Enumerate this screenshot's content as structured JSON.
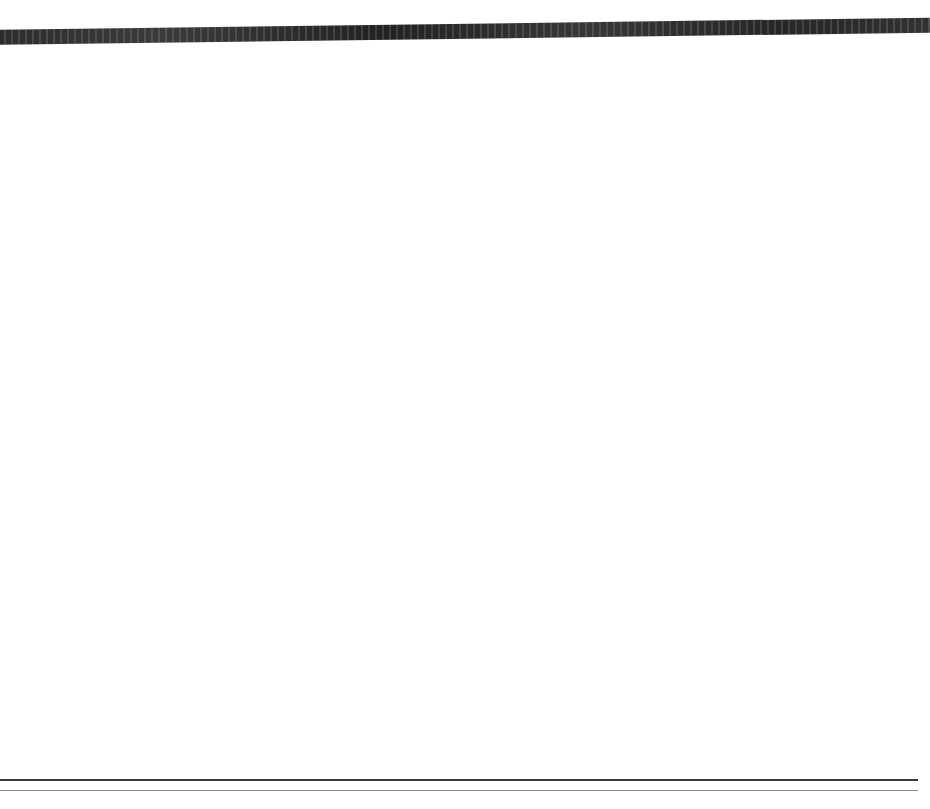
{
  "figure": {
    "y_axis_label": "x",
    "y_axis_label_sub": "t",
    "x_axis_label": "x",
    "x_axis_label_sub": "t-1",
    "caption_fragment": ""
  },
  "chart_data": {
    "type": "scatter",
    "title": "",
    "subtitle": "",
    "xlabel": "x t-1",
    "ylabel": "x t",
    "xlim": [
      0,
      140
    ],
    "ylim": [
      0,
      140
    ],
    "grid": false,
    "legend": null,
    "x_ticks": [
      10,
      20,
      30,
      40,
      50,
      60,
      70,
      80,
      90,
      100,
      110,
      120,
      130,
      140
    ],
    "y_ticks": [
      10,
      20,
      30,
      40,
      50,
      60,
      70,
      80,
      90,
      100,
      110,
      120,
      130,
      140
    ],
    "x": [
      25,
      31,
      32,
      42,
      58,
      59,
      61,
      61,
      63,
      65,
      66,
      66,
      68,
      72,
      80,
      80,
      82,
      82,
      82,
      83,
      85,
      90,
      90,
      92,
      97,
      113,
      122,
      130
    ],
    "y": [
      43,
      42,
      26,
      33,
      68,
      59,
      62,
      67,
      82,
      62,
      66,
      65,
      66,
      84,
      92,
      63,
      74,
      82,
      83,
      99,
      85,
      32,
      94,
      85,
      117,
      132,
      93,
      125
    ],
    "marker": "filled-circle",
    "marker_radius": 7,
    "points": [
      {
        "x": 25,
        "y": 43,
        "highlight": false
      },
      {
        "x": 31,
        "y": 42,
        "highlight": false
      },
      {
        "x": 32,
        "y": 26,
        "highlight": false
      },
      {
        "x": 42,
        "y": 33,
        "highlight": false
      },
      {
        "x": 58,
        "y": 68,
        "highlight": false
      },
      {
        "x": 59,
        "y": 59,
        "highlight": false
      },
      {
        "x": 61,
        "y": 62,
        "highlight": false
      },
      {
        "x": 61,
        "y": 67,
        "highlight": false
      },
      {
        "x": 63,
        "y": 82,
        "highlight": false
      },
      {
        "x": 65,
        "y": 62,
        "highlight": false
      },
      {
        "x": 66,
        "y": 66,
        "highlight": false
      },
      {
        "x": 66,
        "y": 65,
        "highlight": false
      },
      {
        "x": 68,
        "y": 66,
        "highlight": false
      },
      {
        "x": 72,
        "y": 84,
        "highlight": false
      },
      {
        "x": 80,
        "y": 92,
        "highlight": false
      },
      {
        "x": 80,
        "y": 63,
        "highlight": false
      },
      {
        "x": 82,
        "y": 74,
        "highlight": false
      },
      {
        "x": 82,
        "y": 82,
        "highlight": false
      },
      {
        "x": 83,
        "y": 83,
        "highlight": false
      },
      {
        "x": 83,
        "y": 99,
        "highlight": false
      },
      {
        "x": 85,
        "y": 85,
        "highlight": false
      },
      {
        "x": 90,
        "y": 32,
        "highlight": true
      },
      {
        "x": 90,
        "y": 94,
        "highlight": false
      },
      {
        "x": 92,
        "y": 85,
        "highlight": false
      },
      {
        "x": 97,
        "y": 117,
        "highlight": false
      },
      {
        "x": 113,
        "y": 132,
        "highlight": false
      },
      {
        "x": 122,
        "y": 93,
        "highlight": false
      },
      {
        "x": 130,
        "y": 125,
        "highlight": false
      }
    ],
    "fit_line": {
      "type": "linear-regression",
      "x_start": 0,
      "y_start": 12,
      "x_end": 140,
      "y_end": 127,
      "slope": 0.821,
      "intercept": 12
    },
    "colors": {
      "marker": "#111111",
      "line": "#000000",
      "axis": "#000000",
      "background": "#ffffff"
    }
  }
}
